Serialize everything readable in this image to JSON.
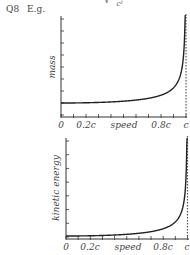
{
  "header": {
    "question": "Q8",
    "example": "E.g.",
    "formula_fragment": "√",
    "formula_denominator": "c²"
  },
  "chart_data": [
    {
      "type": "line",
      "title": "",
      "xlabel": "speed",
      "ylabel": "mass",
      "x_tick_labels": [
        "0",
        "0.2c",
        "speed",
        "0.8c",
        "c"
      ],
      "x_tick_count": 11,
      "y_tick_count": 9,
      "asymptote": "c (dashed vertical line)",
      "description": "Relativistic mass m = m0 / sqrt(1 - v^2/c^2); flat near m0 at low speed, rises steeply to infinity as v approaches c",
      "x": [
        0,
        0.1,
        0.2,
        0.3,
        0.4,
        0.5,
        0.6,
        0.7,
        0.8,
        0.9,
        0.95,
        0.98,
        0.99,
        0.995
      ],
      "values": [
        1.0,
        1.005,
        1.021,
        1.048,
        1.091,
        1.155,
        1.25,
        1.4,
        1.667,
        2.294,
        3.203,
        5.025,
        7.089,
        10.01
      ],
      "grid": false
    },
    {
      "type": "line",
      "title": "",
      "xlabel": "speed",
      "ylabel": "kinetic energy",
      "x_tick_labels": [
        "0",
        "0.2c",
        "speed",
        "0.8c",
        "c"
      ],
      "x_tick_count": 11,
      "y_tick_count": 8,
      "asymptote": "c (dashed vertical line)",
      "description": "Relativistic kinetic energy KE = (gamma - 1) m0 c^2; starts at zero, stays near zero, then rises steeply to infinity as v approaches c",
      "x": [
        0,
        0.1,
        0.2,
        0.3,
        0.4,
        0.5,
        0.6,
        0.7,
        0.8,
        0.9,
        0.95,
        0.98,
        0.99,
        0.995
      ],
      "values": [
        0,
        0.005,
        0.021,
        0.048,
        0.091,
        0.155,
        0.25,
        0.4,
        0.667,
        1.294,
        2.203,
        4.025,
        6.089,
        9.01
      ],
      "grid": false
    }
  ]
}
